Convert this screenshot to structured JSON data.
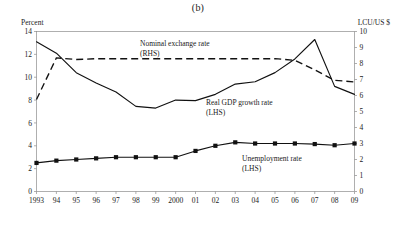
{
  "figure": {
    "panel_label": "(b)",
    "left_axis_title": "Percent",
    "right_axis_title": "LCU/US $"
  },
  "chart_data": {
    "type": "line",
    "title": "(b)",
    "xlabel": "",
    "ylabel": "Percent",
    "y2label": "LCU/US $",
    "grid": false,
    "legend_position": "inline-annotations",
    "x": [
      "1993",
      "94",
      "95",
      "96",
      "97",
      "98",
      "99",
      "2000",
      "01",
      "02",
      "03",
      "04",
      "05",
      "06",
      "07",
      "08",
      "09"
    ],
    "xtick_labels": [
      "1993",
      "94",
      "95",
      "96",
      "97",
      "98",
      "99",
      "2000",
      "01",
      "02",
      "03",
      "04",
      "05",
      "06",
      "07",
      "08",
      "09"
    ],
    "ylim": [
      0,
      14
    ],
    "ytick_labels": [
      "0",
      "2",
      "4",
      "6",
      "8",
      "10",
      "12",
      "14"
    ],
    "ytick_values": [
      0,
      2,
      4,
      6,
      8,
      10,
      12,
      14
    ],
    "y2lim": [
      0,
      10
    ],
    "y2tick_labels": [
      "0",
      "1",
      "2",
      "3",
      "4",
      "5",
      "6",
      "7",
      "8",
      "9",
      "10"
    ],
    "y2tick_values": [
      0,
      1,
      2,
      3,
      4,
      5,
      6,
      7,
      8,
      9,
      10
    ],
    "series": [
      {
        "name": "Real GDP growth rate",
        "axis": "left",
        "style": "solid",
        "markers": false,
        "annotation": "Real GDP growth rate",
        "annotation_sub": "(LHS)",
        "values": [
          13.1,
          12.1,
          10.4,
          9.5,
          8.7,
          7.45,
          7.3,
          8.0,
          7.95,
          8.5,
          9.4,
          9.6,
          10.4,
          11.6,
          13.3,
          9.2,
          8.5
        ]
      },
      {
        "name": "Nominal exchange rate",
        "axis": "right",
        "style": "dashed",
        "markers": false,
        "annotation": "Nominal exchange rate",
        "annotation_sub": "(RHS)",
        "values": [
          5.75,
          8.35,
          8.25,
          8.3,
          8.3,
          8.3,
          8.3,
          8.3,
          8.3,
          8.3,
          8.3,
          8.3,
          8.3,
          8.2,
          7.6,
          6.95,
          6.85
        ]
      },
      {
        "name": "Unemployment rate",
        "axis": "left",
        "style": "solid",
        "markers": true,
        "annotation": "Unemployment rate",
        "annotation_sub": "(LHS)",
        "values": [
          2.5,
          2.7,
          2.8,
          2.9,
          3.0,
          3.0,
          3.0,
          3.0,
          3.55,
          4.0,
          4.3,
          4.2,
          4.2,
          4.2,
          4.15,
          4.05,
          4.2
        ]
      }
    ],
    "annotations": [
      {
        "text": "Nominal exchange rate",
        "sub": "(RHS)",
        "x": 140,
        "y": 46
      },
      {
        "text": "Real GDP growth rate",
        "sub": "(LHS)",
        "x": 206,
        "y": 105
      },
      {
        "text": "Unemployment rate",
        "sub": "(LHS)",
        "x": 242,
        "y": 161
      }
    ]
  },
  "colors": {
    "line": "#111111",
    "frame": "#8d8d8d",
    "text": "#1a1a1a",
    "background": "#ffffff"
  }
}
